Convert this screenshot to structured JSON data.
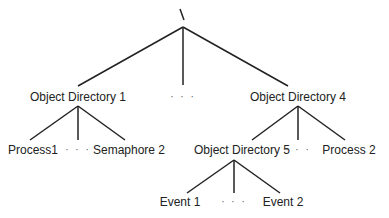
{
  "diagram": {
    "type": "tree",
    "root": {
      "label": "\\",
      "x": 183,
      "y": 14
    },
    "nodes": [
      {
        "id": "od1",
        "label": "Object Directory 1",
        "x": 78,
        "y": 97
      },
      {
        "id": "root_dots",
        "label": "· · ·",
        "x": 183,
        "y": 97
      },
      {
        "id": "od4",
        "label": "Object Directory 4",
        "x": 298,
        "y": 97
      },
      {
        "id": "process1",
        "label": "Process1",
        "x": 33,
        "y": 150
      },
      {
        "id": "od1_dots",
        "label": "· · ·",
        "x": 78,
        "y": 150
      },
      {
        "id": "semaphore2",
        "label": "Semaphore 2",
        "x": 129,
        "y": 150
      },
      {
        "id": "od5",
        "label": "Object Directory 5",
        "x": 242,
        "y": 150
      },
      {
        "id": "od4_dots",
        "label": "· · ·",
        "x": 298,
        "y": 150
      },
      {
        "id": "process2",
        "label": "Process 2",
        "x": 349,
        "y": 150
      },
      {
        "id": "event1",
        "label": "Event 1",
        "x": 180,
        "y": 202
      },
      {
        "id": "od5_dots",
        "label": "· · ·",
        "x": 234,
        "y": 202
      },
      {
        "id": "event2",
        "label": "Event 2",
        "x": 283,
        "y": 202
      }
    ],
    "edges": [
      {
        "x1": 183,
        "y1": 27,
        "x2": 78,
        "y2": 86
      },
      {
        "x1": 183,
        "y1": 27,
        "x2": 183,
        "y2": 85
      },
      {
        "x1": 183,
        "y1": 27,
        "x2": 288,
        "y2": 86
      },
      {
        "x1": 78,
        "y1": 106,
        "x2": 30,
        "y2": 140
      },
      {
        "x1": 78,
        "y1": 106,
        "x2": 78,
        "y2": 140
      },
      {
        "x1": 78,
        "y1": 106,
        "x2": 125,
        "y2": 140
      },
      {
        "x1": 298,
        "y1": 106,
        "x2": 252,
        "y2": 140
      },
      {
        "x1": 298,
        "y1": 106,
        "x2": 298,
        "y2": 140
      },
      {
        "x1": 298,
        "y1": 106,
        "x2": 345,
        "y2": 140
      },
      {
        "x1": 234,
        "y1": 160,
        "x2": 187,
        "y2": 193
      },
      {
        "x1": 234,
        "y1": 160,
        "x2": 234,
        "y2": 193
      },
      {
        "x1": 234,
        "y1": 160,
        "x2": 280,
        "y2": 193
      }
    ],
    "line_color": "#222222"
  }
}
